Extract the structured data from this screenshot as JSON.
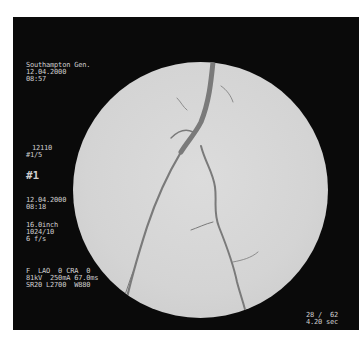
{
  "overlay": {
    "top_left": {
      "hospital": "Southampton Gen.",
      "date": "12.04.2000",
      "time": "08:57"
    },
    "patient": {
      "id": "12110",
      "series": "#1/5",
      "run_label": "#1"
    },
    "acquisition": {
      "date": "12.04.2000",
      "time": "08:18",
      "field_size": "16.0inch",
      "matrix": "1024/10",
      "frame_rate": "6 f/s"
    },
    "geometry": {
      "line1": "F  LAO  0 CRA  0",
      "line2": "81kV  250mA 67.0ms",
      "line3": "SR20 L2700  W880"
    },
    "frame_counter": {
      "current_total": "28 /  62",
      "time": "4.20 sec"
    }
  },
  "colors": {
    "background": "#0a0a0a",
    "field": "#d4d4d4",
    "vessel": "#7a7a7a",
    "text": "#cfcfcf"
  }
}
